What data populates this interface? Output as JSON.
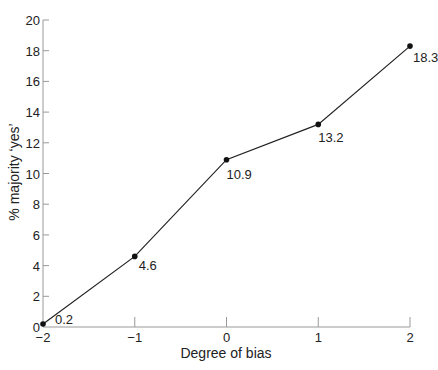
{
  "chart_data": {
    "type": "line",
    "title": "",
    "xlabel": "Degree of bias",
    "ylabel": "% majority ‘yes’",
    "x": [
      -2,
      -1,
      0,
      1,
      2
    ],
    "values": [
      0.2,
      4.6,
      10.9,
      13.2,
      18.3
    ],
    "data_labels": [
      "0.2",
      "4.6",
      "10.9",
      "13.2",
      "18.3"
    ],
    "xlim": [
      -2,
      2
    ],
    "ylim": [
      0,
      20
    ],
    "x_ticks": [
      "−2",
      "−1",
      "0",
      "1",
      "2"
    ],
    "y_ticks": [
      "0",
      "2",
      "4",
      "6",
      "8",
      "10",
      "12",
      "14",
      "16",
      "18",
      "20"
    ],
    "grid": false,
    "legend": null,
    "marker": "filled-circle",
    "line_color": "#222222"
  }
}
